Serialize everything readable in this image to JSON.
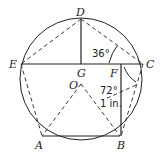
{
  "diagram": {
    "points": {
      "D": "D",
      "E": "E",
      "C": "C",
      "G": "G",
      "F": "F",
      "O": "O",
      "A": "A",
      "B": "B"
    },
    "annotations": {
      "angle_top": "36°",
      "angle_right": "72°",
      "length": "1 in."
    },
    "colors": {
      "stroke": "#222222",
      "background": "#ffffff"
    }
  }
}
